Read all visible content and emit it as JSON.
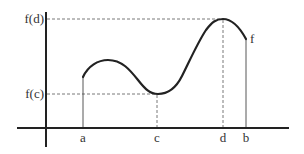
{
  "figure": {
    "y_labels": {
      "max": "f(d)",
      "min": "f(c)"
    },
    "x_labels": {
      "a": "a",
      "c": "c",
      "d": "d",
      "b": "b"
    },
    "curve_label": "f",
    "colors": {
      "curve": "#222222",
      "axes": "#222222",
      "dashed": "#555555",
      "text": "#333333"
    }
  }
}
